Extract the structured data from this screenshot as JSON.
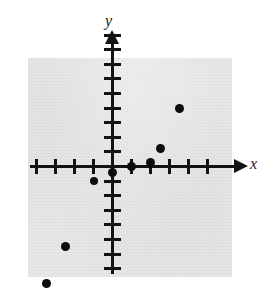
{
  "chart_data": {
    "type": "scatter",
    "title": "",
    "subtitle": "",
    "xlabel": "x",
    "ylabel": "y",
    "grid": false,
    "legend": null,
    "axes": {
      "x_axis_visible": true,
      "y_axis_visible": true,
      "x_arrow": true,
      "y_arrow": true,
      "tick_labels_shown": false,
      "x_tick_count_left": 4,
      "x_tick_count_right": 5,
      "y_tick_count_above": 9,
      "y_tick_count_below": 7,
      "xlim": [
        -5,
        7
      ],
      "ylim": [
        -8,
        10
      ]
    },
    "x_ticks": [
      -4,
      -3,
      -2,
      -1,
      1,
      2,
      3,
      4,
      5
    ],
    "y_ticks": [
      -7,
      -6,
      -5,
      -4,
      -3,
      -2,
      -1,
      1,
      2,
      3,
      4,
      5,
      6,
      7,
      8,
      9
    ],
    "points": [
      {
        "x": -3.5,
        "y": -8
      },
      {
        "x": -2.5,
        "y": -5.5
      },
      {
        "x": -1,
        "y": -1
      },
      {
        "x": 0,
        "y": -0.4
      },
      {
        "x": 1,
        "y": 0
      },
      {
        "x": 2,
        "y": 0.3
      },
      {
        "x": 2.5,
        "y": 1.2
      },
      {
        "x": 3.5,
        "y": 4
      }
    ],
    "point_style": {
      "marker": "filled-circle",
      "color": "#0d0d0d",
      "sizes_px": [
        9,
        9,
        8,
        9,
        9,
        9,
        9,
        9
      ]
    },
    "colors": {
      "axis": "#131313",
      "marker": "#0d0d0d",
      "plot_background": "#e9e8e6",
      "page_background": "#ffffff"
    }
  },
  "labels": {
    "x": "x",
    "y": "y"
  }
}
